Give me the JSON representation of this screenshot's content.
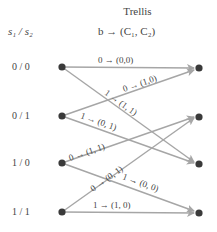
{
  "title": "Trellis",
  "header": {
    "state_label": "s₁ / s₂",
    "mapping_label": "b → (C₁, C₂)"
  },
  "states": [
    "0 / 0",
    "0 / 1",
    "1 / 0",
    "1 / 1"
  ],
  "colors": {
    "edge": "#a6a6a6",
    "node": "#3a3a3a",
    "text": "#444444"
  },
  "transitions": [
    {
      "from": "0 / 0",
      "to": "0 / 0",
      "label": "0 → (0,0)"
    },
    {
      "from": "0 / 0",
      "to": "1 / 0",
      "label": "1 → (1, 1)"
    },
    {
      "from": "0 / 1",
      "to": "0 / 0",
      "label": "0 → (1,0)"
    },
    {
      "from": "0 / 1",
      "to": "1 / 0",
      "label": "1 → (0, 1)"
    },
    {
      "from": "1 / 0",
      "to": "0 / 1",
      "label": "0 → (1, 1)"
    },
    {
      "from": "1 / 0",
      "to": "1 / 1",
      "label": "1 → (0, 0)"
    },
    {
      "from": "1 / 1",
      "to": "0 / 1",
      "label": "0 → (0, 1)"
    },
    {
      "from": "1 / 1",
      "to": "1 / 1",
      "label": "1 → (1, 0)"
    }
  ]
}
